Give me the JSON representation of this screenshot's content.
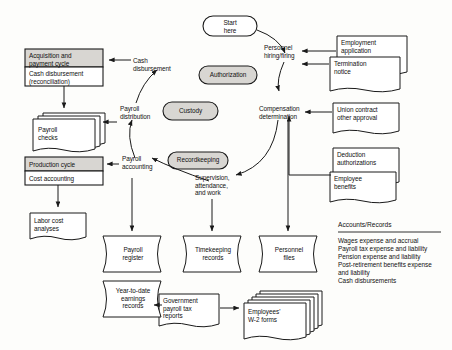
{
  "diagram": {
    "shaded_fill": "#d8d6d2",
    "white_fill": "#ffffff",
    "stroke": "#1a1a1a",
    "background": "#fdfdfb"
  },
  "terminators": {
    "start": "Start\nhere",
    "authorization": "Authorization",
    "custody": "Custody",
    "recordkeeping": "Recordkeeping"
  },
  "cycle_boxes": {
    "acquisition": {
      "header": "Acquisition and\npayment cycle",
      "body": "Cash disbursement\n(reconciliation)"
    },
    "production": {
      "header": "Production cycle",
      "body": "Cost accounting"
    }
  },
  "flow_labels": {
    "cash_disbursement": "Cash\ndisbursement",
    "payroll_distribution": "Payroll\ndistribution",
    "payroll_accounting": "Payroll\naccounting",
    "personnel_hiring_firing": "Personnel\nhiring/firing",
    "compensation_determination": "Compensation\ndetermination",
    "supervision_attendance_work": "Supervision,\nattendance,\nand work"
  },
  "documents": {
    "payroll_checks": "Payroll\nchecks",
    "labor_cost_analyses": "Labor cost\nanalyses",
    "employment_application": "Employment\napplication",
    "termination_notice": "Termination\nnotice",
    "union_contract": "Union contract\nother approval",
    "deduction_authorizations": "Deduction\nauthorizations",
    "employee_benefits": "Employee\nbenefits",
    "government_payroll_tax_reports": "Government\npayroll tax\nreports",
    "employees_w2_forms": "Employees'\nW-2 forms"
  },
  "files": {
    "payroll_register": "Payroll\nregister",
    "year_to_date_earnings": "Year-to-date\nearnings\nrecords",
    "timekeeping_records": "Timekeeping\nrecords",
    "personnel_files": "Personnel\nfiles"
  },
  "accounts_records": {
    "title": "Accounts/Records",
    "items": "Wages expense and accrual\nPayroll tax expense and liability\nPension expense and liability\nPost-retirement benefits expense\n   and liability\nCash disbursements"
  }
}
